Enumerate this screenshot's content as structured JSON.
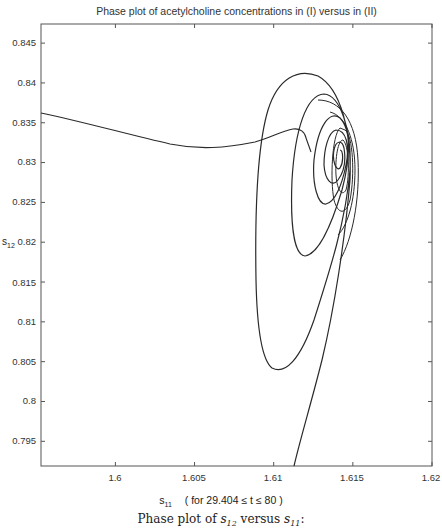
{
  "chart_data": {
    "type": "line",
    "title": "Phase plot of acetylcholine concentrations in (I) versus in (II)",
    "xlabel": "s_11",
    "xlabel_base": "s",
    "xlabel_sub": "11",
    "xlabel_note": "( for  29.404 ≤ t ≤ 80 )",
    "ylabel": "s_12",
    "ylabel_base": "s",
    "ylabel_sub": "12",
    "caption_prefix": "Phase plot of ",
    "caption_mid": " versus ",
    "caption_suffix": ":",
    "xlim": [
      1.5953,
      1.62
    ],
    "ylim": [
      0.7919,
      0.8474
    ],
    "xticks": [
      "1.6",
      "1.605",
      "1.61",
      "1.615",
      "1.62"
    ],
    "yticks": [
      "0.845",
      "0.84",
      "0.835",
      "0.83",
      "0.825",
      "0.82",
      "0.815",
      "0.81",
      "0.805",
      "0.8",
      "0.795"
    ],
    "grid": false,
    "legend": null,
    "line_color": "#2a2a2a",
    "series": [
      {
        "name": "trajectory (s11, s12)",
        "description": "Inward spiral converging to a fixed point near (1.6155, 0.832); starts at lower edge (~1.6115, 0.7919), rises steeply, spirals counter-clockwise with shrinking loops; a separate branch enters from left edge (~1.5953, 0.836) dipping to ~0.8315 at x~1.606 then joins the spiral near (1.6135, 0.8335)",
        "points": [
          [
            1.5953,
            0.836
          ],
          [
            1.599,
            0.8345
          ],
          [
            1.603,
            0.8326
          ],
          [
            1.606,
            0.8316
          ],
          [
            1.609,
            0.8322
          ],
          [
            1.6115,
            0.8338
          ],
          [
            1.6128,
            0.8344
          ],
          [
            1.6135,
            0.8335
          ],
          [
            1.614,
            0.8299
          ],
          [
            1.6115,
            0.7919
          ],
          [
            1.613,
            0.799
          ],
          [
            1.6145,
            0.806
          ],
          [
            1.6152,
            0.813
          ],
          [
            1.6158,
            0.82
          ],
          [
            1.6162,
            0.828
          ],
          [
            1.6161,
            0.835
          ],
          [
            1.615,
            0.8395
          ],
          [
            1.613,
            0.842
          ],
          [
            1.611,
            0.8425
          ],
          [
            1.609,
            0.84
          ],
          [
            1.607,
            0.833
          ],
          [
            1.606,
            0.822
          ],
          [
            1.6062,
            0.812
          ],
          [
            1.607,
            0.806
          ],
          [
            1.6085,
            0.804
          ],
          [
            1.61,
            0.8055
          ],
          [
            1.612,
            0.811
          ],
          [
            1.6138,
            0.818
          ],
          [
            1.615,
            0.826
          ],
          [
            1.6158,
            0.833
          ],
          [
            1.6155,
            0.838
          ],
          [
            1.614,
            0.841
          ],
          [
            1.6128,
            0.8405
          ],
          [
            1.6112,
            0.836
          ],
          [
            1.6105,
            0.828
          ],
          [
            1.6108,
            0.82
          ],
          [
            1.6118,
            0.8165
          ],
          [
            1.6132,
            0.819
          ],
          [
            1.6145,
            0.825
          ],
          [
            1.6154,
            0.832
          ],
          [
            1.6155,
            0.837
          ],
          [
            1.6147,
            0.8388
          ],
          [
            1.6137,
            0.837
          ],
          [
            1.6131,
            0.832
          ],
          [
            1.6133,
            0.8265
          ],
          [
            1.6141,
            0.8245
          ],
          [
            1.615,
            0.8275
          ],
          [
            1.6156,
            0.8325
          ],
          [
            1.6155,
            0.8355
          ],
          [
            1.615,
            0.8365
          ],
          [
            1.6145,
            0.835
          ],
          [
            1.6143,
            0.832
          ],
          [
            1.6146,
            0.8295
          ],
          [
            1.6152,
            0.83
          ],
          [
            1.6155,
            0.832
          ]
        ]
      }
    ]
  }
}
